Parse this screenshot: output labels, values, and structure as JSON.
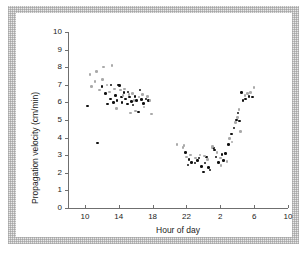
{
  "figure": {
    "background_color": "#ffffff",
    "frame_color": "#e9e9e9",
    "panel_color": "#ffffff"
  },
  "chart_data": {
    "type": "scatter",
    "title": "",
    "xlabel": "Hour of day",
    "ylabel": "Propagation velocity (cm/min)",
    "xlim": [
      8,
      34
    ],
    "ylim": [
      0,
      10
    ],
    "grid": false,
    "legend": "none",
    "xticks": [
      10,
      14,
      18,
      22,
      26,
      30,
      34
    ],
    "xticklabels": [
      "10",
      "14",
      "18",
      "22",
      "2",
      "6",
      "10"
    ],
    "yticks": [
      0,
      1,
      2,
      3,
      4,
      5,
      6,
      7,
      8,
      9,
      10
    ],
    "yticklabels": [
      "0",
      "1",
      "2",
      "3",
      "4",
      "5",
      "6",
      "7",
      "8",
      "9",
      "10"
    ],
    "axis_color": "#6f6f6f",
    "note": "x is hour of day on a 24-h clock continued past midnight; values 24-34 correspond to clock hours 0-10 of the following day",
    "series": [
      {
        "name": "filled-markers",
        "marker": "filled-circle",
        "color": "#101010",
        "points": [
          [
            10.3,
            5.8
          ],
          [
            11.5,
            3.7
          ],
          [
            12.0,
            6.9
          ],
          [
            12.4,
            6.5
          ],
          [
            12.7,
            5.9
          ],
          [
            13.0,
            6.2
          ],
          [
            13.1,
            7.0
          ],
          [
            13.4,
            6.0
          ],
          [
            13.6,
            6.4
          ],
          [
            13.8,
            6.1
          ],
          [
            14.0,
            7.0
          ],
          [
            14.1,
            6.95
          ],
          [
            14.3,
            6.3
          ],
          [
            14.4,
            6.0
          ],
          [
            14.6,
            6.55
          ],
          [
            14.8,
            6.2
          ],
          [
            15.0,
            5.9
          ],
          [
            15.1,
            6.6
          ],
          [
            15.3,
            6.3
          ],
          [
            15.5,
            6.05
          ],
          [
            15.7,
            5.85
          ],
          [
            15.9,
            6.35
          ],
          [
            16.1,
            6.1
          ],
          [
            16.3,
            5.45
          ],
          [
            16.5,
            6.7
          ],
          [
            16.7,
            6.15
          ],
          [
            16.9,
            5.95
          ],
          [
            17.2,
            6.2
          ],
          [
            17.5,
            6.1
          ],
          [
            21.9,
            3.15
          ],
          [
            22.2,
            2.45
          ],
          [
            22.3,
            2.75
          ],
          [
            22.6,
            2.6
          ],
          [
            23.0,
            2.55
          ],
          [
            23.3,
            2.7
          ],
          [
            23.5,
            2.85
          ],
          [
            23.8,
            2.35
          ],
          [
            24.0,
            2.05
          ],
          [
            24.2,
            2.55
          ],
          [
            24.4,
            2.9
          ],
          [
            24.6,
            2.3
          ],
          [
            24.8,
            2.15
          ],
          [
            25.2,
            3.4
          ],
          [
            25.3,
            3.3
          ],
          [
            25.5,
            2.9
          ],
          [
            25.8,
            2.6
          ],
          [
            26.2,
            3.05
          ],
          [
            26.4,
            2.7
          ],
          [
            26.6,
            3.1
          ],
          [
            27.0,
            3.6
          ],
          [
            27.3,
            4.2
          ],
          [
            27.6,
            4.55
          ],
          [
            27.9,
            5.0
          ],
          [
            28.1,
            5.4
          ],
          [
            28.3,
            4.95
          ],
          [
            28.5,
            6.55
          ],
          [
            28.7,
            6.1
          ],
          [
            29.0,
            6.2
          ],
          [
            29.4,
            6.35
          ],
          [
            29.8,
            6.3
          ]
        ]
      },
      {
        "name": "open-markers",
        "marker": "light-circle",
        "color": "#a9a9a9",
        "points": [
          [
            10.6,
            7.6
          ],
          [
            10.8,
            6.9
          ],
          [
            11.2,
            7.2
          ],
          [
            11.4,
            7.75
          ],
          [
            11.7,
            6.7
          ],
          [
            12.1,
            7.3
          ],
          [
            12.2,
            8.0
          ],
          [
            12.6,
            7.0
          ],
          [
            12.9,
            6.6
          ],
          [
            13.2,
            8.1
          ],
          [
            13.5,
            6.75
          ],
          [
            13.7,
            5.65
          ],
          [
            14.2,
            6.7
          ],
          [
            14.5,
            6.4
          ],
          [
            14.7,
            6.75
          ],
          [
            15.2,
            6.45
          ],
          [
            15.4,
            5.4
          ],
          [
            15.6,
            6.5
          ],
          [
            15.8,
            6.1
          ],
          [
            16.0,
            5.5
          ],
          [
            16.4,
            6.3
          ],
          [
            16.8,
            6.45
          ],
          [
            17.0,
            5.75
          ],
          [
            17.4,
            6.35
          ],
          [
            17.7,
            6.1
          ],
          [
            17.9,
            5.35
          ],
          [
            20.9,
            3.6
          ],
          [
            21.6,
            3.45
          ],
          [
            21.7,
            3.55
          ],
          [
            22.0,
            2.9
          ],
          [
            22.5,
            3.0
          ],
          [
            23.1,
            2.85
          ],
          [
            23.6,
            3.0
          ],
          [
            24.1,
            2.95
          ],
          [
            24.5,
            2.75
          ],
          [
            25.0,
            3.45
          ],
          [
            25.1,
            3.5
          ],
          [
            25.6,
            3.15
          ],
          [
            26.0,
            2.85
          ],
          [
            26.1,
            2.4
          ],
          [
            26.8,
            2.65
          ],
          [
            27.1,
            3.95
          ],
          [
            27.4,
            3.75
          ],
          [
            27.8,
            4.85
          ],
          [
            28.0,
            5.15
          ],
          [
            28.2,
            5.6
          ],
          [
            28.4,
            4.35
          ],
          [
            28.9,
            6.4
          ],
          [
            29.2,
            6.5
          ],
          [
            29.6,
            6.55
          ],
          [
            30.0,
            6.85
          ]
        ]
      }
    ]
  }
}
